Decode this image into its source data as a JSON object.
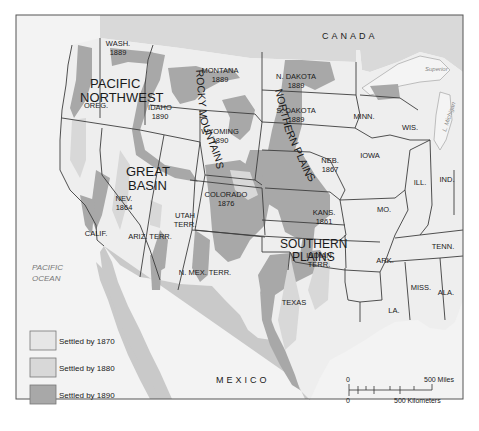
{
  "map": {
    "colors": {
      "canada": "#d9d9d9",
      "mexico": "#c9c9c9",
      "ocean": "#f3f3f3",
      "us_land": "#eeeeee",
      "settled_1870": "#e6e6e6",
      "settled_1880": "#d8d8d8",
      "settled_1890": "#a8a8a8",
      "great_lakes": "#f4f4f4",
      "border": "#3d3d3d"
    },
    "countries": {
      "canada": "CANADA",
      "mexico": "MEXICO"
    },
    "ocean": {
      "line1": "PACIFIC",
      "line2": "OCEAN"
    },
    "lakes": {
      "superior": "Superior",
      "michigan": "L. Michigan"
    },
    "regions": {
      "pacific_northwest": [
        "PACIFIC",
        "NORTHWEST"
      ],
      "great_basin": [
        "GREAT",
        "BASIN"
      ],
      "rocky_mountains": "ROCKY MOUNTAINS",
      "northern_plains": "NORTHERN PLAINS",
      "southern_plains": [
        "SOUTHERN",
        "PLAINS"
      ]
    },
    "states": [
      {
        "id": "wash",
        "name": "WASH.",
        "year": "1889"
      },
      {
        "id": "oreg",
        "name": "OREG.",
        "year": ""
      },
      {
        "id": "idaho",
        "name": "IDAHO",
        "year": "1890"
      },
      {
        "id": "montana",
        "name": "MONTANA",
        "year": "1889"
      },
      {
        "id": "wyoming",
        "name": "WYOMING",
        "year": "1890"
      },
      {
        "id": "ndakota",
        "name": "N. DAKOTA",
        "year": "1889"
      },
      {
        "id": "sdakota",
        "name": "S. DAKOTA",
        "year": "1889"
      },
      {
        "id": "neb",
        "name": "NEB.",
        "year": "1867"
      },
      {
        "id": "kans",
        "name": "KANS.",
        "year": "1861"
      },
      {
        "id": "colorado",
        "name": "COLORADO",
        "year": "1876"
      },
      {
        "id": "nev",
        "name": "NEV.",
        "year": "1864"
      },
      {
        "id": "utah",
        "name": "UTAH",
        "year": "TERR."
      },
      {
        "id": "calif",
        "name": "CALIF.",
        "year": ""
      },
      {
        "id": "ariz",
        "name": "ARIZ. TERR.",
        "year": ""
      },
      {
        "id": "nmex",
        "name": "N. MEX. TERR.",
        "year": ""
      },
      {
        "id": "indian",
        "name": "INDIAN",
        "year": "TERR."
      },
      {
        "id": "texas",
        "name": "TEXAS",
        "year": ""
      },
      {
        "id": "minn",
        "name": "MINN.",
        "year": ""
      },
      {
        "id": "wis",
        "name": "WIS.",
        "year": ""
      },
      {
        "id": "iowa",
        "name": "IOWA",
        "year": ""
      },
      {
        "id": "ill",
        "name": "ILL.",
        "year": ""
      },
      {
        "id": "ind",
        "name": "IND.",
        "year": ""
      },
      {
        "id": "mo",
        "name": "MO.",
        "year": ""
      },
      {
        "id": "ark",
        "name": "ARK.",
        "year": ""
      },
      {
        "id": "tenn",
        "name": "TENN.",
        "year": ""
      },
      {
        "id": "miss",
        "name": "MISS.",
        "year": ""
      },
      {
        "id": "ala",
        "name": "ALA.",
        "year": ""
      },
      {
        "id": "la",
        "name": "LA.",
        "year": ""
      }
    ],
    "legend": [
      {
        "label": "Settled by 1870",
        "color_key": "settled_1870"
      },
      {
        "label": "Settled by 1880",
        "color_key": "settled_1880"
      },
      {
        "label": "Settled by 1890",
        "color_key": "settled_1890"
      }
    ],
    "scale": {
      "zero_top": "0",
      "miles": "500 Miles",
      "zero_bottom": "0",
      "km": "500 Kilometers"
    }
  }
}
